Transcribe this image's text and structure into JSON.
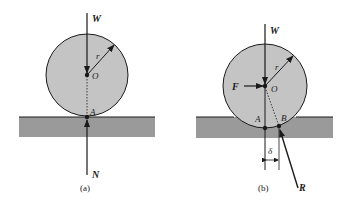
{
  "colors": {
    "disk_fill": "#c4c4c4",
    "ground_fill": "#9a9a9a",
    "stroke": "#1a1a1a",
    "background": "#ffffff"
  },
  "panel_a": {
    "caption": "(a)",
    "labels": {
      "weight": "W",
      "radius": "r",
      "center": "O",
      "contact": "A",
      "normal": "N"
    }
  },
  "panel_b": {
    "caption": "(b)",
    "labels": {
      "weight": "W",
      "radius": "r",
      "center": "O",
      "force": "F",
      "point_a": "A",
      "point_b": "B",
      "offset": "δ",
      "reaction": "R"
    }
  }
}
